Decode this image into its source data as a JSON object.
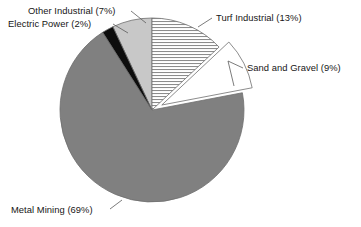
{
  "chart_data": {
    "type": "pie",
    "title": "",
    "subtitle": "",
    "xlabel": "",
    "ylabel": "",
    "legend_position": "none",
    "grid": false,
    "start_angle_deg": 0,
    "direction": "clockwise",
    "units": "percent",
    "categories": [
      "Turf Industrial",
      "Sand and Gravel",
      "Metal Mining",
      "Electric Power",
      "Other Industrial"
    ],
    "values": [
      13,
      9,
      69,
      2,
      7
    ],
    "labels": [
      "Turf Industrial (13%)",
      "Sand and Gravel (9%)",
      "Metal Mining (69%)",
      "Electric Power (2%)",
      "Other Industrial (7%)"
    ],
    "slices": [
      {
        "name": "Turf Industrial",
        "label": "Turf Industrial (13%)",
        "value": 13,
        "fill": "horizontal-hatch",
        "color": "#ffffff",
        "hatch_color": "#8c8c8c",
        "exploded": false
      },
      {
        "name": "Sand and Gravel",
        "label": "Sand and Gravel (9%)",
        "value": 9,
        "fill": "solid",
        "color": "#ffffff",
        "hatch_color": "",
        "exploded": true
      },
      {
        "name": "Metal Mining",
        "label": "Metal Mining (69%)",
        "value": 69,
        "fill": "solid",
        "color": "#808080",
        "hatch_color": "",
        "exploded": false
      },
      {
        "name": "Electric Power",
        "label": "Electric Power (2%)",
        "value": 2,
        "fill": "solid",
        "color": "#0d0d0d",
        "hatch_color": "",
        "exploded": false
      },
      {
        "name": "Other Industrial",
        "label": "Other Industrial (7%)",
        "value": 7,
        "fill": "solid",
        "color": "#c8c8c8",
        "hatch_color": "",
        "exploded": false
      }
    ]
  },
  "colors": {
    "background": "#ffffff",
    "text": "#161616",
    "outline": "#6e6e6e",
    "leader": "#5a5a5a",
    "metal_mining": "#808080",
    "other_industrial": "#c8c8c8",
    "electric_power": "#0d0d0d",
    "sand_and_gravel": "#ffffff",
    "turf_industrial": "#ffffff"
  }
}
